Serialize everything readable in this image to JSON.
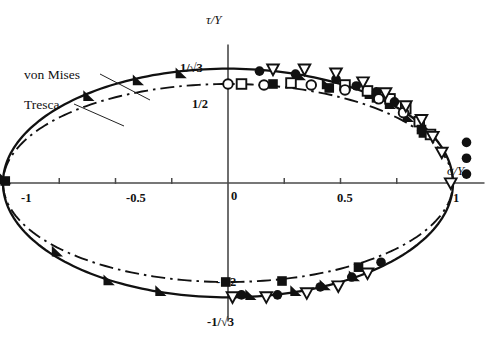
{
  "figure": {
    "axes": {
      "x_axis_label": "σ/Y",
      "y_axis_label": "τ/Y",
      "origin_label": "0",
      "x_tick_labels": [
        {
          "text": "-1",
          "value": -1
        },
        {
          "text": "-0.5",
          "value": -0.5
        },
        {
          "text": "0.5",
          "value": 0.5
        },
        {
          "text": "1",
          "value": 1
        }
      ],
      "y_tick_labels": [
        {
          "text": "1/√3",
          "value": 0.5774
        },
        {
          "text": "1/2",
          "value": 0.5
        },
        {
          "text": "-1/2",
          "value": -0.5
        },
        {
          "text": "-1/√3",
          "value": -0.5774
        }
      ]
    },
    "annotations": [
      {
        "name": "von-mises-label",
        "text": "von Mises"
      },
      {
        "name": "tresca-label",
        "text": "Tresca"
      }
    ]
  },
  "chart_data": {
    "type": "scatter",
    "title": "",
    "xlabel": "σ/Y",
    "ylabel": "τ/Y",
    "xlim": [
      -1.12,
      1.12
    ],
    "ylim": [
      -0.72,
      0.72
    ],
    "grid": false,
    "legend_position": "inline-annotation",
    "x_ticks": [
      -1,
      -0.75,
      -0.5,
      -0.25,
      0,
      0.25,
      0.5,
      0.75,
      1
    ],
    "x_tick_labels_shown": [
      "-1",
      "-0.5",
      "0.5",
      "1"
    ],
    "y_ticks": [
      -0.5774,
      -0.5,
      0.5,
      0.5774
    ],
    "curves": [
      {
        "name": "von Mises",
        "style": "solid",
        "equation": "(sigma/Y)^2 + 3*(tau/Y)^2 = 1",
        "semi_axis_x": 1.0,
        "semi_axis_y": 0.5774,
        "color": "#111111"
      },
      {
        "name": "Tresca",
        "style": "dash-dot",
        "equation": "(sigma/Y)^2 + 4*(tau/Y)^2 = 1",
        "semi_axis_x": 1.0,
        "semi_axis_y": 0.5,
        "color": "#111111"
      }
    ],
    "series": [
      {
        "name": "filled-right-triangle",
        "marker": "triangle-right-filled",
        "points": [
          [
            -0.99,
            0.02
          ],
          [
            -0.62,
            0.44
          ],
          [
            -0.4,
            0.52
          ],
          [
            -0.21,
            0.555
          ],
          [
            0.32,
            0.545
          ],
          [
            0.44,
            0.5
          ],
          [
            0.63,
            0.45
          ],
          [
            0.72,
            0.4
          ],
          [
            0.8,
            0.335
          ],
          [
            0.87,
            0.255
          ],
          [
            -0.76,
            -0.345
          ],
          [
            -0.53,
            -0.49
          ],
          [
            -0.3,
            -0.545
          ],
          [
            0.1,
            -0.565
          ],
          [
            0.3,
            -0.545
          ],
          [
            0.43,
            -0.515
          ],
          [
            0.56,
            -0.47
          ]
        ]
      },
      {
        "name": "open-square",
        "marker": "square-open",
        "points": [
          [
            0.06,
            0.5
          ],
          [
            0.28,
            0.505
          ],
          [
            0.52,
            0.495
          ],
          [
            0.62,
            0.465
          ],
          [
            0.72,
            0.425
          ],
          [
            0.79,
            0.375
          ],
          [
            0.85,
            0.31
          ],
          [
            0.9,
            0.245
          ]
        ]
      },
      {
        "name": "filled-square",
        "marker": "square-filled",
        "points": [
          [
            -0.99,
            0.01
          ],
          [
            0.2,
            0.5
          ],
          [
            0.45,
            0.48
          ],
          [
            0.66,
            0.43
          ],
          [
            0.86,
            0.27
          ],
          [
            -0.01,
            -0.5
          ],
          [
            0.24,
            -0.495
          ],
          [
            0.58,
            -0.425
          ]
        ]
      },
      {
        "name": "filled-circle",
        "marker": "circle-filled",
        "points": [
          [
            0.14,
            0.565
          ],
          [
            0.3,
            0.55
          ],
          [
            0.48,
            0.525
          ],
          [
            0.57,
            0.49
          ],
          [
            0.66,
            0.46
          ],
          [
            0.74,
            0.41
          ],
          [
            1.06,
            0.205
          ],
          [
            1.06,
            0.125
          ],
          [
            1.06,
            0.045
          ],
          [
            0.06,
            -0.565
          ],
          [
            0.22,
            -0.565
          ],
          [
            0.41,
            -0.525
          ],
          [
            0.55,
            -0.475
          ],
          [
            0.68,
            -0.4
          ]
        ]
      },
      {
        "name": "open-circle",
        "marker": "circle-open",
        "points": [
          [
            0.0,
            0.5
          ],
          [
            0.16,
            0.495
          ],
          [
            0.37,
            0.495
          ],
          [
            0.52,
            0.47
          ],
          [
            0.67,
            0.425
          ],
          [
            0.78,
            0.355
          ]
        ]
      },
      {
        "name": "open-down-triangle",
        "marker": "triangle-down-open",
        "points": [
          [
            0.2,
            0.575
          ],
          [
            0.34,
            0.575
          ],
          [
            0.48,
            0.555
          ],
          [
            0.6,
            0.51
          ],
          [
            0.7,
            0.455
          ],
          [
            0.79,
            0.39
          ],
          [
            0.86,
            0.32
          ],
          [
            0.91,
            0.235
          ],
          [
            0.95,
            0.155
          ],
          [
            0.99,
            0.0
          ],
          [
            0.02,
            -0.575
          ],
          [
            0.17,
            -0.575
          ],
          [
            0.35,
            -0.555
          ],
          [
            0.49,
            -0.52
          ],
          [
            0.62,
            -0.455
          ]
        ]
      }
    ]
  }
}
